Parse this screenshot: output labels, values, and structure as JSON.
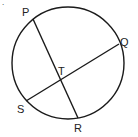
{
  "diagram": {
    "type": "circle-with-intersecting-chords",
    "points": {
      "P": {
        "label": "P"
      },
      "Q": {
        "label": "Q"
      },
      "R": {
        "label": "R"
      },
      "S": {
        "label": "S"
      },
      "T": {
        "label": "T"
      }
    },
    "chords": [
      "PR",
      "QS"
    ],
    "intersection": "T",
    "stroke_color": "#1a1a1a"
  }
}
